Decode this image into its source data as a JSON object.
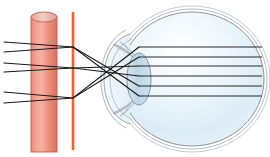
{
  "figure": {
    "type": "optical-ray-diagram",
    "width": 270,
    "height": 157,
    "background_color": "#ffffff"
  },
  "colors": {
    "object_cylinder_body_light": "#f5a795",
    "object_cylinder_body_mid": "#e8887a",
    "object_cylinder_body_dark": "#d9705f",
    "object_cylinder_outline": "#c4604f",
    "object_cylinder_top_fill": "#f0c3b8",
    "aperture_line": "#f4602a",
    "aperture_line_glow": "#f9a07a",
    "ray_stroke": "#1a1a1a",
    "eye_outer_outline": "#8e949c",
    "eye_sclera_fill": "#ffffff",
    "eye_vitreous_top": "#dfeef7",
    "eye_vitreous_bottom": "#eef6fb",
    "cornea_outline": "#9aa4ad",
    "lens_fill": "#c3d9e8",
    "lens_outline": "#7d97a8",
    "iris_outline": "#8b97a2",
    "retina_line": "#b9c4cc"
  },
  "object": {
    "label": "object-cylinder",
    "shape": "cylinder",
    "x": 31,
    "y": 12,
    "width": 26,
    "height": 140,
    "top_ellipse_ry": 5
  },
  "aperture": {
    "label": "pinhole-aperture-plane",
    "shape": "vertical-line",
    "x": 73,
    "y_top": 12,
    "y_bottom": 150,
    "thickness": 3
  },
  "eye": {
    "label": "human-eye",
    "center_x": 192,
    "center_y": 79,
    "radius_x": 72,
    "radius_y": 72,
    "layers": [
      {
        "name": "sclera",
        "offset": 0
      },
      {
        "name": "choroid",
        "offset": 3
      },
      {
        "name": "retina",
        "offset": 6
      }
    ],
    "cornea": {
      "name": "cornea",
      "apex_x": 108,
      "top_y": 38,
      "bottom_y": 120
    },
    "lens": {
      "name": "crystalline-lens",
      "center_x": 139,
      "center_y": 79,
      "radius_x": 12,
      "radius_y": 26
    },
    "iris": {
      "name": "iris",
      "top_y": 50,
      "bottom_y": 108
    }
  },
  "rays": {
    "count": 6,
    "description": "Six light rays leave the object, cross in pairs at the pinhole plane, and travel horizontally through the eye to the retina.",
    "object_y": [
      42,
      52,
      63,
      72,
      92,
      103
    ],
    "crossing_x": 73,
    "crossing_y": [
      47,
      68,
      98
    ],
    "eye_y": [
      47,
      57,
      66,
      76,
      86,
      96
    ]
  },
  "ray_paths": [
    {
      "name": "ray-1",
      "start_y": 42,
      "cross_y": 47,
      "end_y": 96
    },
    {
      "name": "ray-2",
      "start_y": 52,
      "cross_y": 47,
      "end_y": 86
    },
    {
      "name": "ray-3",
      "start_y": 63,
      "cross_y": 68,
      "end_y": 76
    },
    {
      "name": "ray-4",
      "start_y": 72,
      "cross_y": 68,
      "end_y": 66
    },
    {
      "name": "ray-5",
      "start_y": 92,
      "cross_y": 98,
      "end_y": 57
    },
    {
      "name": "ray-6",
      "start_y": 103,
      "cross_y": 98,
      "end_y": 47
    }
  ],
  "interior_rays": {
    "name": "interior-horizontal-rays",
    "start_x": 139,
    "end_x": 262,
    "y": [
      47,
      57,
      66,
      76,
      86,
      96
    ]
  }
}
